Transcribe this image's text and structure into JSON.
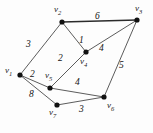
{
  "figure": {
    "type": "weighted-undirected-graph",
    "width": 153,
    "height": 133,
    "background_color": "#fdfdfd",
    "edge_color": "#4a4a4a",
    "vertex_color": "#111111",
    "label_color": "#141414"
  },
  "vertices": [
    {
      "id": "v1",
      "name": "v",
      "sub": "1",
      "x": 20,
      "y": 75,
      "label_x": 5,
      "label_y": 66
    },
    {
      "id": "v2",
      "name": "v",
      "sub": "2",
      "x": 62,
      "y": 22,
      "label_x": 54,
      "label_y": 5
    },
    {
      "id": "v3",
      "name": "v",
      "sub": "3",
      "x": 137,
      "y": 20,
      "label_x": 135,
      "label_y": 4
    },
    {
      "id": "v4",
      "name": "v",
      "sub": "4",
      "x": 86,
      "y": 52,
      "label_x": 80,
      "label_y": 57
    },
    {
      "id": "v5",
      "name": "v",
      "sub": "5",
      "x": 50,
      "y": 88,
      "label_x": 45,
      "label_y": 71
    },
    {
      "id": "v6",
      "name": "v",
      "sub": "6",
      "x": 104,
      "y": 97,
      "label_x": 107,
      "label_y": 101
    },
    {
      "id": "v7",
      "name": "v",
      "sub": "7",
      "x": 57,
      "y": 105,
      "label_x": 49,
      "label_y": 108
    }
  ],
  "edges": [
    {
      "id": "e-v1-v2",
      "from": "v1",
      "to": "v2",
      "weight": "3",
      "label_x": 26,
      "label_y": 40,
      "thick": false
    },
    {
      "id": "e-v2-v3",
      "from": "v2",
      "to": "v3",
      "weight": "6",
      "label_x": 95,
      "label_y": 12,
      "thick": true
    },
    {
      "id": "e-v2-v4",
      "from": "v2",
      "to": "v4",
      "weight": "1",
      "label_x": 79,
      "label_y": 36,
      "thick": false
    },
    {
      "id": "e-v3-v4",
      "from": "v3",
      "to": "v4",
      "weight": "4",
      "label_x": 99,
      "label_y": 44,
      "thick": false
    },
    {
      "id": "e-v3-v6",
      "from": "v3",
      "to": "v6",
      "weight": "5",
      "label_x": 119,
      "label_y": 61,
      "thick": false
    },
    {
      "id": "e-v1-v5",
      "from": "v1",
      "to": "v5",
      "weight": "2",
      "label_x": 30,
      "label_y": 70,
      "thick": false
    },
    {
      "id": "e-v4-v5",
      "from": "v4",
      "to": "v5",
      "weight": "2",
      "label_x": 58,
      "label_y": 54,
      "thick": false
    },
    {
      "id": "e-v5-v6",
      "from": "v5",
      "to": "v6",
      "weight": "4",
      "label_x": 75,
      "label_y": 78,
      "thick": false
    },
    {
      "id": "e-v1-v7",
      "from": "v1",
      "to": "v7",
      "weight": "8",
      "label_x": 29,
      "label_y": 90,
      "thick": false
    },
    {
      "id": "e-v6-v7",
      "from": "v6",
      "to": "v7",
      "weight": "3",
      "label_x": 79,
      "label_y": 105,
      "thick": false
    }
  ],
  "chart_data": {
    "type": "diagram",
    "title": "",
    "nodes": [
      "v1",
      "v2",
      "v3",
      "v4",
      "v5",
      "v6",
      "v7"
    ],
    "edges": [
      {
        "endpoints": [
          "v1",
          "v2"
        ],
        "weight": 3
      },
      {
        "endpoints": [
          "v2",
          "v3"
        ],
        "weight": 6
      },
      {
        "endpoints": [
          "v2",
          "v4"
        ],
        "weight": 1
      },
      {
        "endpoints": [
          "v3",
          "v4"
        ],
        "weight": 4
      },
      {
        "endpoints": [
          "v3",
          "v6"
        ],
        "weight": 5
      },
      {
        "endpoints": [
          "v1",
          "v5"
        ],
        "weight": 2
      },
      {
        "endpoints": [
          "v4",
          "v5"
        ],
        "weight": 2
      },
      {
        "endpoints": [
          "v5",
          "v6"
        ],
        "weight": 4
      },
      {
        "endpoints": [
          "v1",
          "v7"
        ],
        "weight": 8
      },
      {
        "endpoints": [
          "v6",
          "v7"
        ],
        "weight": 3
      }
    ]
  }
}
